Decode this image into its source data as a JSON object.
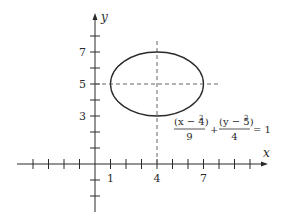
{
  "diagram": {
    "type": "ellipse-graph",
    "equation": {
      "term1_numerator": "(x − 4)",
      "term1_exp": "2",
      "term1_denominator": "9",
      "plus": "+",
      "term2_numerator": "(y − 5)",
      "term2_exp": "2",
      "term2_denominator": "4",
      "equals": "= 1"
    },
    "axes": {
      "x_label": "x",
      "y_label": "y",
      "x_tick_labels": [
        "1",
        "4",
        "7"
      ],
      "y_tick_labels": [
        "7",
        "5",
        "3"
      ]
    },
    "ellipse": {
      "center": [
        4,
        5
      ],
      "semi_major_x": 3,
      "semi_minor_y": 2
    },
    "colors": {
      "stroke": "#2a2a2a",
      "dashed": "#666666"
    }
  }
}
